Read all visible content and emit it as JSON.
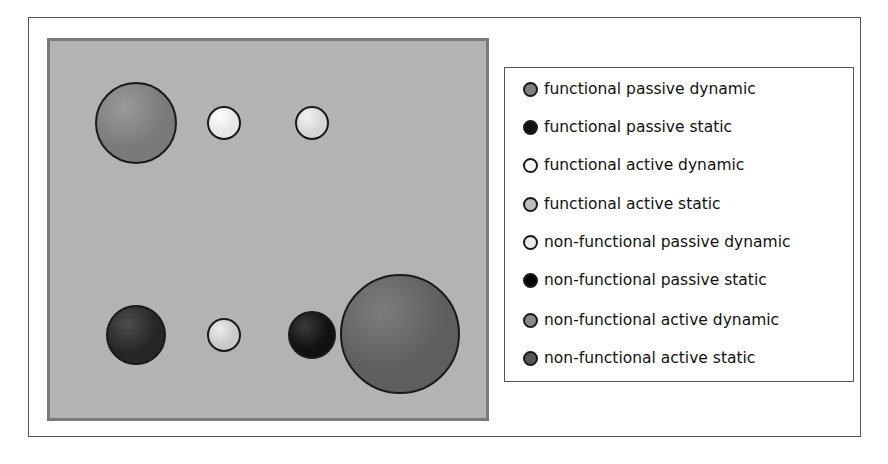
{
  "figure": {
    "spheres": [
      {
        "id": "s1",
        "category": "functional passive dynamic",
        "cx": 136,
        "cy": 123,
        "r": 41,
        "fill": "#7a7a7a",
        "highlight": "#9a9a9a"
      },
      {
        "id": "s2",
        "category": "functional active dynamic",
        "cx": 224,
        "cy": 123,
        "r": 17,
        "fill": "#e6e6e6",
        "highlight": "#ffffff"
      },
      {
        "id": "s3",
        "category": "non-functional passive dynamic",
        "cx": 312,
        "cy": 123,
        "r": 17,
        "fill": "#d6d6d6",
        "highlight": "#f2f2f2"
      },
      {
        "id": "s4",
        "category": "functional passive static",
        "cx": 136,
        "cy": 335,
        "r": 30,
        "fill": "#262626",
        "highlight": "#4d4d4d"
      },
      {
        "id": "s5",
        "category": "functional active static",
        "cx": 224,
        "cy": 335,
        "r": 17,
        "fill": "#c9c9c9",
        "highlight": "#ececec"
      },
      {
        "id": "s6",
        "category": "non-functional passive static",
        "cx": 312,
        "cy": 335,
        "r": 24,
        "fill": "#111111",
        "highlight": "#3a3a3a"
      },
      {
        "id": "s7",
        "category": "non-functional active static",
        "cx": 400,
        "cy": 334,
        "r": 60,
        "fill": "#5e5e5e",
        "highlight": "#7d7d7d"
      }
    ]
  },
  "legend": {
    "items": [
      {
        "label": "functional passive dynamic",
        "color": "#808080"
      },
      {
        "label": "functional passive static",
        "color": "#111111"
      },
      {
        "label": "functional active dynamic",
        "color": "#ffffff"
      },
      {
        "label": "functional active static",
        "color": "#bdbdbd"
      },
      {
        "label": "non-functional passive dynamic",
        "color": "#ececec"
      },
      {
        "label": "non-functional passive static",
        "color": "#000000"
      },
      {
        "label": "non-functional active dynamic",
        "color": "#8a8a8a"
      },
      {
        "label": "non-functional active static",
        "color": "#555555"
      }
    ]
  }
}
